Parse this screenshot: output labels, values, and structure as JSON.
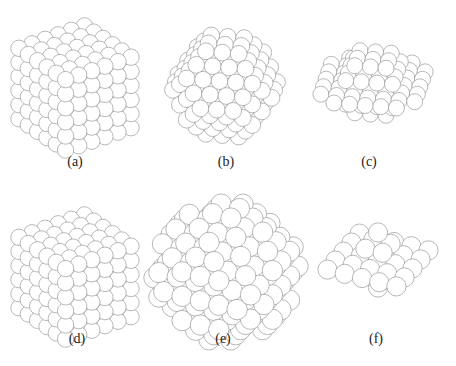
{
  "figure": {
    "background": "#ffffff",
    "sphere_stroke": "#9a9a9a",
    "sphere_fill": "#ffffff",
    "panels": [
      {
        "id": "a",
        "caption": "(a)",
        "shape": "cube",
        "cx": 75,
        "cy": 88,
        "r": 8.2,
        "n": 6,
        "cap_x": 75,
        "cap_y": 163
      },
      {
        "id": "b",
        "caption": "(b)",
        "shape": "cuboct",
        "cx": 225,
        "cy": 86,
        "r": 8.4,
        "n": 5,
        "cap_x": 226,
        "cap_y": 163
      },
      {
        "id": "c",
        "caption": "(c)",
        "shape": "flat-octa",
        "cx": 373,
        "cy": 83,
        "r": 8.0,
        "n": 5,
        "cap_x": 369,
        "cap_y": 163
      },
      {
        "id": "d",
        "caption": "(d)",
        "shape": "cube",
        "cx": 75,
        "cy": 277,
        "r": 8.2,
        "n": 6,
        "cap_x": 77,
        "cap_y": 340
      },
      {
        "id": "e",
        "caption": "(e)",
        "shape": "rhombic",
        "cx": 226,
        "cy": 272,
        "r": 10.2,
        "n": 5,
        "cap_x": 223,
        "cap_y": 340
      },
      {
        "id": "f",
        "caption": "(f)",
        "shape": "flat-rhombic",
        "cx": 378,
        "cy": 260,
        "r": 9.6,
        "n": 4,
        "cap_x": 376,
        "cap_y": 340
      }
    ]
  }
}
